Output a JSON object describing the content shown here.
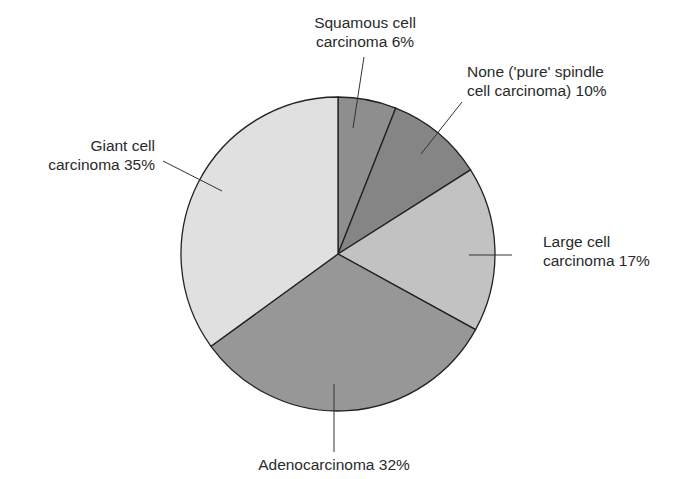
{
  "chart_data": {
    "type": "pie",
    "title": "",
    "start_angle_deg": 0,
    "direction": "clockwise",
    "slices": [
      {
        "name": "Squamous cell carcinoma",
        "value": 6,
        "color": "#8e8e8e",
        "label_lines": [
          "Squamous cell",
          "carcinoma 6%"
        ]
      },
      {
        "name": "None ('pure' spindle cell carcinoma)",
        "value": 10,
        "color": "#858585",
        "label_lines": [
          "None ('pure' spindle",
          "cell carcinoma) 10%"
        ]
      },
      {
        "name": "Large cell carcinoma",
        "value": 17,
        "color": "#c2c2c2",
        "label_lines": [
          "Large cell",
          "carcinoma 17%"
        ]
      },
      {
        "name": "Adenocarcinoma",
        "value": 32,
        "color": "#979797",
        "label_lines": [
          "Adenocarcinoma 32%"
        ]
      },
      {
        "name": "Giant cell carcinoma",
        "value": 35,
        "color": "#e0e0e0",
        "label_lines": [
          "Giant cell",
          "carcinoma 35%"
        ]
      }
    ],
    "categories": [
      "Squamous cell carcinoma",
      "None ('pure' spindle cell carcinoma)",
      "Large cell carcinoma",
      "Adenocarcinoma",
      "Giant cell carcinoma"
    ],
    "values": [
      6,
      10,
      17,
      32,
      35
    ],
    "unit": "%",
    "legend": "none (direct labels with leader lines)"
  },
  "labels": {
    "squamous": {
      "line1": "Squamous cell",
      "line2": "carcinoma 6%"
    },
    "none": {
      "line1": "None ('pure' spindle",
      "line2": "cell carcinoma) 10%"
    },
    "large": {
      "line1": "Large cell",
      "line2": "carcinoma 17%"
    },
    "adeno": {
      "line1": "Adenocarcinoma 32%"
    },
    "giant": {
      "line1": "Giant cell",
      "line2": "carcinoma 35%"
    }
  }
}
